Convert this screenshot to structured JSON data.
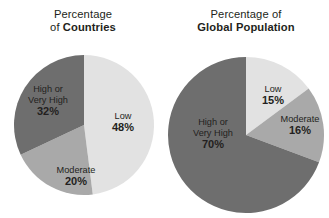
{
  "figure": {
    "background_color": "#ffffff",
    "width": 329,
    "height": 218
  },
  "palette": {
    "low": "#e2e2e2",
    "moderate": "#a9a9a9",
    "high_or_very_high": "#6e6e6e",
    "text": "#231f20"
  },
  "charts": {
    "countries": {
      "title_line1": "Percentage",
      "title_line2_prefix": "of ",
      "title_line2_strong": "Countries",
      "slices": [
        {
          "name_line1": "Low",
          "name_line2": "",
          "value": "48%"
        },
        {
          "name_line1": "Moderate",
          "name_line2": "",
          "value": "20%"
        },
        {
          "name_line1": "High or",
          "name_line2": "Very High",
          "value": "32%"
        }
      ]
    },
    "population": {
      "title_line1": "Percentage of",
      "title_line2_prefix": "",
      "title_line2_strong": "Global Population",
      "slices": [
        {
          "name_line1": "Low",
          "name_line2": "",
          "value": "15%"
        },
        {
          "name_line1": "Moderate",
          "name_line2": "",
          "value": "16%"
        },
        {
          "name_line1": "High or",
          "name_line2": "Very High",
          "value": "70%"
        }
      ]
    }
  },
  "chart_data": [
    {
      "type": "pie",
      "title": "Percentage of Countries",
      "categories": [
        "Low",
        "Moderate",
        "High or Very High"
      ],
      "values": [
        48,
        20,
        32
      ],
      "value_labels": [
        "48%",
        "20%",
        "32%"
      ],
      "colors": [
        "#e2e2e2",
        "#a9a9a9",
        "#6e6e6e"
      ],
      "start_angle_deg": 0,
      "direction": "clockwise",
      "legend": "none",
      "labels_inside": true,
      "center_px": [
        84,
        125
      ],
      "radius_px": 70
    },
    {
      "type": "pie",
      "title": "Percentage of Global Population",
      "categories": [
        "Low",
        "Moderate",
        "High or Very High"
      ],
      "values": [
        15,
        16,
        70
      ],
      "value_labels": [
        "15%",
        "16%",
        "70%"
      ],
      "colors": [
        "#e2e2e2",
        "#a9a9a9",
        "#6e6e6e"
      ],
      "start_angle_deg": 0,
      "direction": "clockwise",
      "legend": "none",
      "labels_inside": true,
      "center_px": [
        246,
        135
      ],
      "radius_px": 78
    }
  ]
}
